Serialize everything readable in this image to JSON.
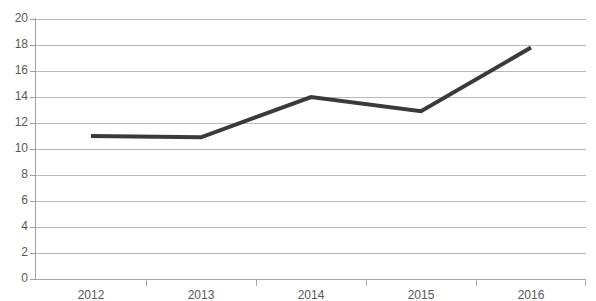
{
  "chart_data": {
    "type": "line",
    "title": "",
    "subtitle": "",
    "xlabel": "",
    "ylabel": "",
    "categories": [
      "2012",
      "2013",
      "2014",
      "2015",
      "2016"
    ],
    "series": [
      {
        "name": "series-1",
        "values": [
          11.0,
          10.9,
          14.0,
          12.9,
          17.8
        ],
        "color": "#3a3a3a",
        "line_width": 4,
        "markers": false
      }
    ],
    "ylim": [
      0,
      20
    ],
    "ytick_step": 2,
    "ytick_labels": [
      "20",
      "18",
      "16",
      "14",
      "12",
      "10",
      "8",
      "6",
      "4",
      "2",
      "0"
    ],
    "ytick_values": [
      20,
      18,
      16,
      14,
      12,
      10,
      8,
      6,
      4,
      2,
      0
    ],
    "grid": {
      "horizontal": true,
      "vertical": false,
      "color": "#b9b9bd"
    },
    "legend": {
      "visible": false,
      "position": "none",
      "entries": []
    },
    "axis": {
      "x_axis_color": "#a8a8ac",
      "y_axis_color": "#9d9da2",
      "tick_marks": "between-categories"
    },
    "annotations": [],
    "background": "#ffffff"
  },
  "chart": {
    "title_remnant": ""
  }
}
